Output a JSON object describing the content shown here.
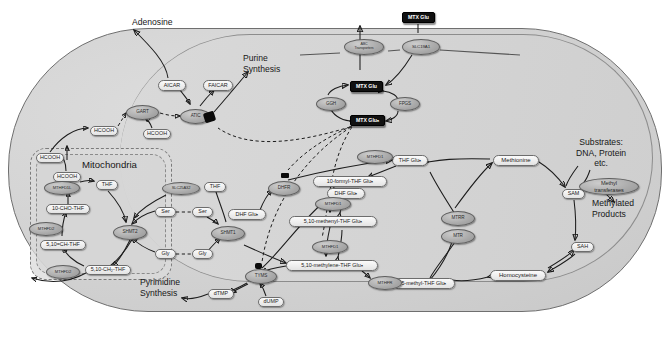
{
  "diagram": {
    "annotations": [
      {
        "id": "adenosine",
        "text": "Adenosine",
        "x": 132,
        "y": 22,
        "align": "left",
        "size": 8.8
      },
      {
        "id": "purine",
        "text": "Purine\nSynthesis",
        "x": 243,
        "y": 58,
        "align": "left",
        "size": 8.8
      },
      {
        "id": "mitochondria",
        "text": "Mitochondria",
        "x": 82,
        "y": 166,
        "align": "left",
        "size": 9.6
      },
      {
        "id": "substrates",
        "text": "Substrates:\nDNA, Protein\netc.",
        "x": 576,
        "y": 142,
        "align": "center",
        "size": 8.6
      },
      {
        "id": "methylated",
        "text": "Methylated\nProducts",
        "x": 604,
        "y": 200,
        "align": "center",
        "size": 8.8
      },
      {
        "id": "pyrimidine",
        "text": "Pyrimidine\nSynthesis",
        "x": 145,
        "y": 282,
        "align": "left",
        "size": 8.8
      }
    ],
    "metabolites": [
      {
        "id": "aicar",
        "label": "AICAR",
        "x": 158,
        "y": 80,
        "w": 28,
        "h": 11
      },
      {
        "id": "faicar",
        "label": "FAICAR",
        "x": 203,
        "y": 80,
        "w": 30,
        "h": 11
      },
      {
        "id": "hcooh-cyto-left",
        "label": "HCOOH",
        "x": 90,
        "y": 126,
        "w": 28,
        "h": 10
      },
      {
        "id": "hcooh-gart",
        "label": "HCOOH",
        "x": 143,
        "y": 129,
        "w": 28,
        "h": 10
      },
      {
        "id": "hcooh-mito-edge",
        "label": "HCOOH",
        "x": 36,
        "y": 153,
        "w": 28,
        "h": 10
      },
      {
        "id": "hcooh-mito-in",
        "label": "HCOOH",
        "x": 53,
        "y": 172,
        "w": 28,
        "h": 10
      },
      {
        "id": "thf-mito",
        "label": "THF",
        "x": 96,
        "y": 180,
        "w": 22,
        "h": 10
      },
      {
        "id": "10cho-thf",
        "label": "10-CHO-THF",
        "x": 46,
        "y": 204,
        "w": 44,
        "h": 10
      },
      {
        "id": "510ch-thf",
        "label": "5,10=CH-THF",
        "x": 40,
        "y": 240,
        "w": 46,
        "h": 10
      },
      {
        "id": "510ch2-thf",
        "label": "5,10-CH₂-THF",
        "x": 85,
        "y": 265,
        "w": 46,
        "h": 10
      },
      {
        "id": "ser-mito",
        "label": "Ser",
        "x": 155,
        "y": 207,
        "w": 21,
        "h": 10
      },
      {
        "id": "ser-cyto",
        "label": "Ser",
        "x": 192,
        "y": 207,
        "w": 21,
        "h": 10
      },
      {
        "id": "gly-mito",
        "label": "Gly",
        "x": 155,
        "y": 249,
        "w": 21,
        "h": 10
      },
      {
        "id": "gly-cyto",
        "label": "Gly",
        "x": 192,
        "y": 249,
        "w": 21,
        "h": 10
      },
      {
        "id": "thf-cyto",
        "label": "THF",
        "x": 204,
        "y": 182,
        "w": 22,
        "h": 10
      },
      {
        "id": "dhf-glun",
        "label": "DHF Gluₙ",
        "x": 228,
        "y": 209,
        "w": 38,
        "h": 11
      },
      {
        "id": "dhf-glun-right",
        "label": "DHF Gluₙ",
        "x": 327,
        "y": 188,
        "w": 38,
        "h": 11
      },
      {
        "id": "thf-glun",
        "label": "THF Gluₙ",
        "x": 392,
        "y": 155,
        "w": 36,
        "h": 11
      },
      {
        "id": "10formyl",
        "label": "10-formyl-THF Gluₙ",
        "x": 313,
        "y": 176,
        "w": 74,
        "h": 11
      },
      {
        "id": "510methenyl",
        "label": "5,10-methenyl-THF Gluₙ",
        "x": 289,
        "y": 216,
        "w": 88,
        "h": 11
      },
      {
        "id": "510methylene",
        "label": "5,10-methylene-THF Gluₙ",
        "x": 286,
        "y": 260,
        "w": 92,
        "h": 11
      },
      {
        "id": "5methyl",
        "label": "5-methyl-THF Gluₙ",
        "x": 393,
        "y": 278,
        "w": 62,
        "h": 11
      },
      {
        "id": "dtmp",
        "label": "dTMP",
        "x": 208,
        "y": 289,
        "w": 26,
        "h": 10
      },
      {
        "id": "dump",
        "label": "dUMP",
        "x": 258,
        "y": 297,
        "w": 26,
        "h": 10
      },
      {
        "id": "methionine",
        "label": "Methionine",
        "x": 493,
        "y": 155,
        "w": 46,
        "h": 11
      },
      {
        "id": "sam",
        "label": "SAM",
        "x": 562,
        "y": 189,
        "w": 23,
        "h": 10
      },
      {
        "id": "sah",
        "label": "SAH",
        "x": 571,
        "y": 242,
        "w": 23,
        "h": 10
      },
      {
        "id": "homocysteine",
        "label": "Homocysteine",
        "x": 490,
        "y": 270,
        "w": 56,
        "h": 11
      }
    ],
    "enzymes": [
      {
        "id": "gart",
        "label": "GART",
        "x": 126,
        "y": 105,
        "w": 33,
        "h": 15
      },
      {
        "id": "atic",
        "label": "ATIC",
        "x": 180,
        "y": 109,
        "w": 31,
        "h": 15
      },
      {
        "id": "ggh",
        "label": "GGH",
        "x": 316,
        "y": 97,
        "w": 30,
        "h": 14
      },
      {
        "id": "fpgs",
        "label": "FPGS",
        "x": 390,
        "y": 97,
        "w": 30,
        "h": 14
      },
      {
        "id": "abc",
        "label": "ABC\nTransporters",
        "x": 344,
        "y": 39,
        "w": 40,
        "h": 16
      },
      {
        "id": "slc19a1",
        "label": "SLC19A1",
        "x": 402,
        "y": 39,
        "w": 38,
        "h": 16
      },
      {
        "id": "mthfd1l",
        "label": "MTHFD1L",
        "x": 44,
        "y": 181,
        "w": 36,
        "h": 14
      },
      {
        "id": "mthfd2-1",
        "label": "MTHFD2",
        "x": 29,
        "y": 222,
        "w": 34,
        "h": 14
      },
      {
        "id": "mthfd2-2",
        "label": "MTHFD2",
        "x": 46,
        "y": 265,
        "w": 34,
        "h": 14
      },
      {
        "id": "shmt2",
        "label": "SHMT2",
        "x": 113,
        "y": 225,
        "w": 34,
        "h": 15
      },
      {
        "id": "slc25a32",
        "label": "SLC25A32",
        "x": 162,
        "y": 182,
        "w": 38,
        "h": 13
      },
      {
        "id": "shmt1",
        "label": "SHMT1",
        "x": 211,
        "y": 226,
        "w": 34,
        "h": 15
      },
      {
        "id": "dhfr",
        "label": "DHFR",
        "x": 268,
        "y": 181,
        "w": 32,
        "h": 15
      },
      {
        "id": "mthfd1-top",
        "label": "MTHFD1",
        "x": 357,
        "y": 150,
        "w": 36,
        "h": 14
      },
      {
        "id": "mthfd1-mid",
        "label": "MTHFD1",
        "x": 315,
        "y": 197,
        "w": 36,
        "h": 14
      },
      {
        "id": "mthfd1-low",
        "label": "MTHFD1",
        "x": 312,
        "y": 240,
        "w": 36,
        "h": 14
      },
      {
        "id": "mthfr",
        "label": "MTHFR",
        "x": 368,
        "y": 276,
        "w": 34,
        "h": 14
      },
      {
        "id": "tyms",
        "label": "TYMS",
        "x": 245,
        "y": 269,
        "w": 32,
        "h": 15
      },
      {
        "id": "mtrr",
        "label": "MTRR",
        "x": 441,
        "y": 211,
        "w": 34,
        "h": 15
      },
      {
        "id": "mtr",
        "label": "MTR",
        "x": 441,
        "y": 229,
        "w": 34,
        "h": 15
      },
      {
        "id": "methyltransferases",
        "label": "Methyl\ntransferases",
        "x": 579,
        "y": 178,
        "w": 60,
        "h": 17
      }
    ],
    "drugs": [
      {
        "id": "mtx-glu-extracellular",
        "label": "MTX Glu",
        "x": 402,
        "y": 12,
        "w": 33,
        "h": 11
      },
      {
        "id": "mtx-glu-cytosol",
        "label": "MTX Glu",
        "x": 350,
        "y": 81,
        "w": 33,
        "h": 11
      },
      {
        "id": "mtx-glun-cytosol",
        "label": "MTX Gluₙ",
        "x": 350,
        "y": 115,
        "w": 35,
        "h": 11
      }
    ],
    "inhibitions": [
      {
        "id": "dhfr-inhibition",
        "target": "dhfr",
        "x": 281,
        "y": 173,
        "w": 8,
        "h": 6
      },
      {
        "id": "atic-inhibition",
        "target": "atic",
        "x": 205,
        "y": 113,
        "w": 11,
        "h": 10
      },
      {
        "id": "tyms-inhibition",
        "target": "tyms",
        "x": 255,
        "y": 263,
        "w": 7,
        "h": 6
      }
    ],
    "colors": {
      "cell_fill": "#d2d2d2",
      "cell_border": "#6f6f6f",
      "metabolite_fill": "#f0f0f0",
      "enzyme_fill": "#a9a9a9",
      "drug_fill": "#111111",
      "drug_text": "#ffffff",
      "arrow": "#1c1c1c"
    }
  }
}
